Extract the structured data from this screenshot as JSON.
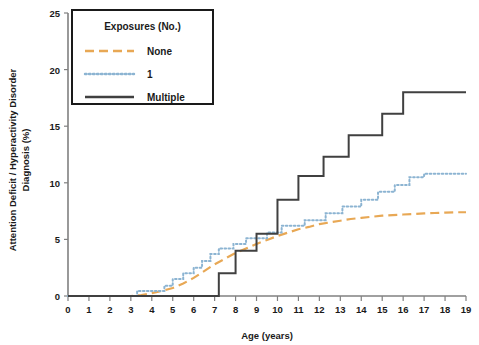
{
  "chart_data": {
    "type": "line",
    "title": "",
    "xlabel": "Age (years)",
    "ylabel": "Attention Deficit / Hyperactivity Disorder Diagnosis (%)",
    "ylabel_line1": "Attention Deficit / Hyperactivity Disorder",
    "ylabel_line2": "Diagnosis (%)",
    "xlim": [
      0,
      19
    ],
    "ylim": [
      0,
      25
    ],
    "xticks": [
      0,
      1,
      2,
      3,
      4,
      5,
      6,
      7,
      8,
      9,
      10,
      11,
      12,
      13,
      14,
      15,
      16,
      17,
      18,
      19
    ],
    "xtick_labels": [
      "0",
      "1",
      "2",
      "3",
      "4",
      "5",
      "6",
      "7",
      "8",
      "9",
      "10",
      "11",
      "12",
      "13",
      "14",
      "15",
      "16",
      "17",
      "18",
      "19"
    ],
    "yticks": [
      0,
      5,
      10,
      15,
      20,
      25
    ],
    "ytick_labels": [
      "0",
      "5",
      "10",
      "15",
      "20",
      "25"
    ],
    "grid": false,
    "legend_position": "top-left",
    "legend_title": "Exposures (No.)",
    "series": [
      {
        "name": "None",
        "color": "#E8A855",
        "style": "dashed",
        "points": [
          [
            0,
            0
          ],
          [
            1,
            0
          ],
          [
            2,
            0
          ],
          [
            3,
            0
          ],
          [
            3.5,
            0.08
          ],
          [
            4,
            0.25
          ],
          [
            4.5,
            0.45
          ],
          [
            5,
            0.7
          ],
          [
            5.5,
            1.1
          ],
          [
            6,
            1.6
          ],
          [
            6.5,
            2.2
          ],
          [
            7,
            2.8
          ],
          [
            7.5,
            3.3
          ],
          [
            8,
            3.8
          ],
          [
            8.5,
            4.2
          ],
          [
            9,
            4.6
          ],
          [
            9.5,
            4.95
          ],
          [
            10,
            5.3
          ],
          [
            10.5,
            5.6
          ],
          [
            11,
            5.9
          ],
          [
            11.5,
            6.1
          ],
          [
            12,
            6.35
          ],
          [
            12.5,
            6.5
          ],
          [
            13,
            6.65
          ],
          [
            13.5,
            6.8
          ],
          [
            14,
            6.9
          ],
          [
            14.5,
            7.0
          ],
          [
            15,
            7.1
          ],
          [
            15.5,
            7.15
          ],
          [
            16,
            7.2
          ],
          [
            16.5,
            7.25
          ],
          [
            17,
            7.3
          ],
          [
            17.5,
            7.33
          ],
          [
            18,
            7.37
          ],
          [
            18.5,
            7.4
          ],
          [
            19,
            7.4
          ]
        ]
      },
      {
        "name": "1",
        "color": "#8CB4D2",
        "style": "dotted",
        "points": [
          [
            0,
            0
          ],
          [
            3.3,
            0
          ],
          [
            3.3,
            0.45
          ],
          [
            4.6,
            0.45
          ],
          [
            4.6,
            0.9
          ],
          [
            5.0,
            0.9
          ],
          [
            5.0,
            1.5
          ],
          [
            5.5,
            1.5
          ],
          [
            5.5,
            2.0
          ],
          [
            6.0,
            2.0
          ],
          [
            6.0,
            2.5
          ],
          [
            6.4,
            2.5
          ],
          [
            6.4,
            3.1
          ],
          [
            6.8,
            3.1
          ],
          [
            6.8,
            3.7
          ],
          [
            7.2,
            3.7
          ],
          [
            7.2,
            4.2
          ],
          [
            7.9,
            4.2
          ],
          [
            7.9,
            4.6
          ],
          [
            8.5,
            4.6
          ],
          [
            8.5,
            5.1
          ],
          [
            9.5,
            5.1
          ],
          [
            9.5,
            5.6
          ],
          [
            10.2,
            5.6
          ],
          [
            10.2,
            6.2
          ],
          [
            11.3,
            6.2
          ],
          [
            11.3,
            6.7
          ],
          [
            12.3,
            6.7
          ],
          [
            12.3,
            7.3
          ],
          [
            13.1,
            7.3
          ],
          [
            13.1,
            7.9
          ],
          [
            14.0,
            7.9
          ],
          [
            14.0,
            8.5
          ],
          [
            14.8,
            8.5
          ],
          [
            14.8,
            9.2
          ],
          [
            15.6,
            9.2
          ],
          [
            15.6,
            9.8
          ],
          [
            16.3,
            9.8
          ],
          [
            16.3,
            10.5
          ],
          [
            17.0,
            10.5
          ],
          [
            17.0,
            10.8
          ],
          [
            19,
            10.8
          ]
        ]
      },
      {
        "name": "Multiple",
        "color": "#404040",
        "style": "solid",
        "points": [
          [
            0,
            0
          ],
          [
            7.2,
            0
          ],
          [
            7.2,
            2.0
          ],
          [
            8.0,
            2.0
          ],
          [
            8.0,
            4.0
          ],
          [
            9.0,
            4.0
          ],
          [
            9.0,
            5.5
          ],
          [
            10.0,
            5.5
          ],
          [
            10.0,
            8.5
          ],
          [
            11.0,
            8.5
          ],
          [
            11.0,
            10.6
          ],
          [
            12.2,
            10.6
          ],
          [
            12.2,
            12.3
          ],
          [
            13.4,
            12.3
          ],
          [
            13.4,
            14.2
          ],
          [
            15.0,
            14.2
          ],
          [
            15.0,
            16.1
          ],
          [
            16.0,
            16.1
          ],
          [
            16.0,
            18.0
          ],
          [
            19,
            18.0
          ]
        ]
      }
    ]
  }
}
